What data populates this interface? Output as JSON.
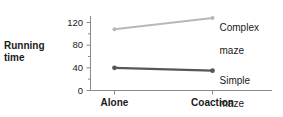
{
  "chart_data": {
    "type": "line",
    "title": "",
    "xlabel": "",
    "ylabel": "Running time",
    "ylabel_line1": "Running",
    "ylabel_line2": "time",
    "categories": [
      "Alone",
      "Coaction"
    ],
    "yticks": [
      0,
      40,
      80,
      120
    ],
    "ytick_labels": [
      "0",
      "40",
      "80",
      "120"
    ],
    "minor_tick_step": 20,
    "ylim": [
      0,
      140
    ],
    "grid": false,
    "legend_position": "end-of-line",
    "series": [
      {
        "name": "Complex maze",
        "label_line1": "Complex",
        "label_line2": "maze",
        "color": "#b8b8b8",
        "values": [
          108,
          128
        ]
      },
      {
        "name": "Simple maze",
        "label_line1": "Simple",
        "label_line2": "maze",
        "color": "#575757",
        "values": [
          40,
          35
        ]
      }
    ]
  },
  "axis": {
    "color": "#8a8a8a"
  }
}
